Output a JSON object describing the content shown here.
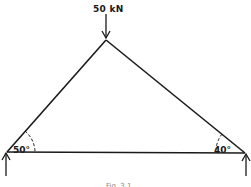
{
  "diagram": {
    "load": {
      "label": "50 kN",
      "direction": "down"
    },
    "angles": {
      "left": "50°",
      "right": "40°"
    },
    "caption": "Fig. 3.1",
    "colors": {
      "stroke": "#1a1a1a",
      "background": "#ffffff"
    }
  }
}
